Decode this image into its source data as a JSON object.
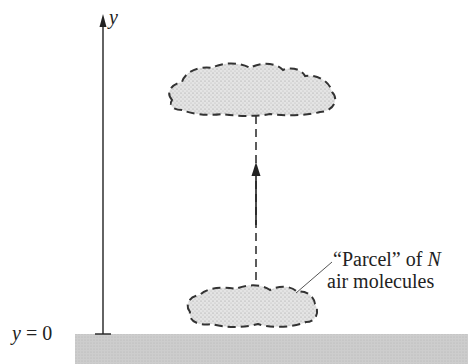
{
  "diagram": {
    "axis_label": "y",
    "origin_label": "y = 0",
    "origin_var": "y",
    "origin_eq": "= 0",
    "parcel_label_line1_prefix": "“Parcel” of ",
    "parcel_label_var": "N",
    "parcel_label_line2": "air molecules"
  },
  "colors": {
    "ground": "#c8c8c8",
    "cloud_fill": "#dcdcdc",
    "stroke": "#222222"
  }
}
